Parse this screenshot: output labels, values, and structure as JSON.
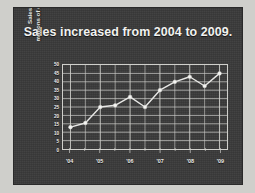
{
  "slide": {
    "title": "Sales increased from 2004 to 2009.",
    "background_color": "#3a3a3a",
    "border_color": "#cfcfcb",
    "text_color": "#f2f2f0"
  },
  "chart_data": {
    "type": "line",
    "title": "Sales increased from 2004 to 2009.",
    "xlabel": "",
    "ylabel": "Sales, millions of dollars",
    "ylabel_lines": [
      "Sales,",
      "millions of dollars"
    ],
    "ylim": [
      0,
      50
    ],
    "yticks": [
      0,
      5,
      10,
      15,
      20,
      25,
      30,
      35,
      40,
      45,
      50
    ],
    "ytick_labels": [
      "0",
      "5",
      "10",
      "15",
      "20",
      "25",
      "30",
      "35",
      "40",
      "45",
      "50"
    ],
    "xtick_labels": [
      "'04",
      "'05",
      "'06",
      "'07",
      "'08",
      "'09"
    ],
    "xtick_values": [
      2004,
      2005,
      2006,
      2007,
      2008,
      2009
    ],
    "xlim": [
      2003.75,
      2009.25
    ],
    "grid": true,
    "grid_color": "#cfcfcb",
    "legend": false,
    "marker": "circle",
    "line_color": "#e8e8e6",
    "marker_color": "#f5f5f3",
    "x": [
      2004.0,
      2004.5,
      2005.0,
      2005.5,
      2006.0,
      2006.5,
      2007.0,
      2007.5,
      2008.0,
      2008.5,
      2009.0
    ],
    "values": [
      13,
      15.5,
      25,
      26,
      31,
      25,
      35,
      40,
      43,
      37.5,
      45
    ],
    "series": [
      {
        "name": "Sales",
        "values": [
          13,
          15.5,
          25,
          26,
          31,
          25,
          35,
          40,
          43,
          37.5,
          45
        ]
      }
    ]
  }
}
